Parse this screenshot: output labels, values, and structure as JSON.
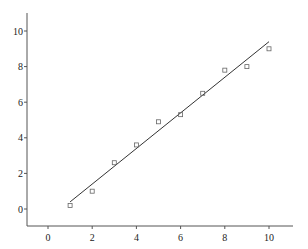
{
  "chart_data": {
    "type": "scatter",
    "title": "",
    "xlabel": "",
    "ylabel": "",
    "xlim": [
      -1,
      11
    ],
    "ylim": [
      -1,
      11
    ],
    "x_ticks": [
      0,
      2,
      4,
      6,
      8,
      10
    ],
    "y_ticks": [
      0,
      2,
      4,
      6,
      8,
      10
    ],
    "grid": false,
    "legend": null,
    "series": [
      {
        "name": "observations",
        "kind": "scatter",
        "marker": "open-square",
        "x": [
          1,
          2,
          3,
          4,
          5,
          6,
          7,
          8,
          9,
          10
        ],
        "y": [
          0.2,
          1.0,
          2.6,
          3.6,
          4.9,
          5.3,
          6.5,
          7.8,
          8.0,
          9.0
        ]
      },
      {
        "name": "linear fit",
        "kind": "line",
        "x": [
          1,
          10
        ],
        "y": [
          0.4,
          9.4
        ]
      }
    ]
  },
  "axis_labels": {
    "x": [
      "0",
      "2",
      "4",
      "6",
      "8",
      "10"
    ],
    "y": [
      "0",
      "2",
      "4",
      "6",
      "8",
      "10"
    ]
  },
  "colors": {
    "axis": "#555555",
    "line": "#333333",
    "marker": "#666666",
    "background": "#ffffff"
  }
}
